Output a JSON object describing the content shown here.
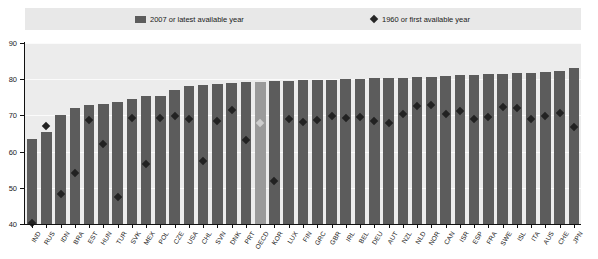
{
  "legend": {
    "bar_label": "2007 or latest available year",
    "diamond_label": "1960 or first available year",
    "bar_color": "#5c5c5c",
    "diamond_color": "#262626"
  },
  "chart_data": {
    "type": "bar",
    "title": "",
    "subtitle": "",
    "xlabel": "",
    "ylabel": "",
    "ylim": [
      40,
      90
    ],
    "yticks": [
      40,
      50,
      60,
      70,
      80,
      90
    ],
    "grid": true,
    "legend_position": "top",
    "highlight_category": "OECD",
    "highlight_bar_color": "#9a9a9a",
    "categories": [
      "IND",
      "RUS",
      "IDN",
      "BRA",
      "EST",
      "HUN",
      "TUR",
      "SVK",
      "MEX",
      "POL",
      "CZE",
      "USA",
      "CHL",
      "SVN",
      "DNK",
      "PRT",
      "OECD",
      "KOR",
      "LUX",
      "FIN",
      "GRC",
      "GBR",
      "IRL",
      "BEL",
      "DEU",
      "AUT",
      "NZL",
      "NLD",
      "NOR",
      "CAN",
      "ISR",
      "ESP",
      "FRA",
      "SWE",
      "ISL",
      "ITA",
      "AUS",
      "CHE",
      "JPN"
    ],
    "series": [
      {
        "name": "2007 or latest available year",
        "type": "bar",
        "values": [
          63.5,
          65.5,
          70.0,
          72.0,
          73.0,
          73.2,
          73.8,
          74.5,
          75.3,
          75.5,
          77.0,
          78.0,
          78.5,
          78.8,
          78.9,
          79.1,
          79.2,
          79.4,
          79.6,
          79.7,
          79.8,
          79.9,
          80.0,
          80.1,
          80.2,
          80.3,
          80.4,
          80.5,
          80.7,
          81.0,
          81.2,
          81.3,
          81.4,
          81.5,
          81.7,
          81.8,
          81.9,
          82.2,
          83.0
        ]
      },
      {
        "name": "1960 or first available year",
        "type": "scatter",
        "marker": "diamond",
        "values": [
          41.0,
          68.0,
          49.0,
          55.0,
          69.7,
          63.0,
          48.3,
          70.2,
          57.5,
          70.0,
          70.7,
          69.9,
          58.2,
          69.3,
          72.2,
          63.9,
          68.7,
          52.7,
          69.8,
          69.0,
          69.7,
          70.8,
          70.0,
          70.5,
          69.4,
          68.8,
          71.3,
          73.4,
          73.6,
          71.1,
          72.0,
          69.8,
          70.3,
          73.1,
          73.0,
          69.8,
          70.8,
          71.5,
          67.7
        ]
      }
    ]
  }
}
